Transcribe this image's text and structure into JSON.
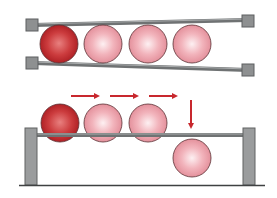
{
  "diagram": {
    "colors": {
      "background": "#ffffff",
      "rail": "#6f7273",
      "rail_highlight": "#a9acad",
      "block_fill": "#8e9091",
      "block_stroke": "#5d5f60",
      "post_fill": "#9a9c9d",
      "post_stroke": "#606263",
      "floor": "#3f4142",
      "ball_dark_center": "#e8807f",
      "ball_dark_edge": "#b01e22",
      "ball_light_center": "#fde9ec",
      "ball_light_edge": "#e08a94",
      "ball_stroke": "#5a3033",
      "arrow": "#c8282e"
    },
    "top_panel": {
      "label": "Converging rails holding four balls",
      "balls": [
        {
          "kind": "dark"
        },
        {
          "kind": "light"
        },
        {
          "kind": "light"
        },
        {
          "kind": "light"
        }
      ]
    },
    "bottom_panel": {
      "label": "Balls rolling along rail, last ball drops",
      "balls_on_rail": [
        {
          "kind": "dark"
        },
        {
          "kind": "light"
        },
        {
          "kind": "light"
        }
      ],
      "dropped_ball": {
        "kind": "light"
      },
      "arrows": [
        {
          "direction": "right"
        },
        {
          "direction": "right"
        },
        {
          "direction": "right"
        },
        {
          "direction": "down"
        }
      ]
    }
  }
}
